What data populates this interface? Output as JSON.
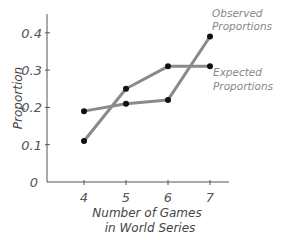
{
  "chart_data": {
    "type": "line",
    "title": "",
    "xlabel": "Number of Games in World Series",
    "xlabel_lines": [
      "Number of Games",
      "in World Series"
    ],
    "ylabel": "Proportion",
    "categories": [
      4,
      5,
      6,
      7
    ],
    "x_tick_labels": [
      "4",
      "5",
      "6",
      "7"
    ],
    "y_tick_labels": [
      "0",
      "0.1",
      "0.2",
      "0.3",
      "0.4"
    ],
    "y_ticks": [
      0,
      0.1,
      0.2,
      0.3,
      0.4
    ],
    "ylim": [
      0,
      0.45
    ],
    "grid": false,
    "legend_position": "inline-right",
    "series": [
      {
        "name": "Observed Proportions",
        "label_lines": [
          "Observed",
          "Proportions"
        ],
        "values": [
          0.19,
          0.21,
          0.22,
          0.39
        ]
      },
      {
        "name": "Expected Proportions",
        "label_lines": [
          "Expected",
          "Proportions"
        ],
        "values": [
          0.11,
          0.25,
          0.31,
          0.31
        ]
      }
    ],
    "colors": {
      "line": "#8a8a8a",
      "marker": "#111111",
      "axis": "#555555"
    }
  }
}
